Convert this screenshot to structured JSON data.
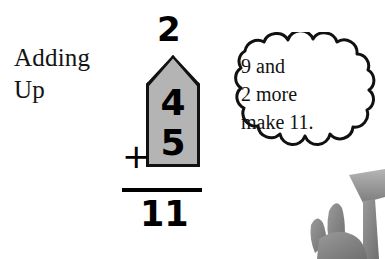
{
  "page": {
    "background_color": "#ffffff",
    "ink_color": "#000000"
  },
  "heading": {
    "line1": "Adding",
    "line2": "Up"
  },
  "problem": {
    "carry": "2",
    "addend_tens": "4",
    "addend_ones": "5",
    "operator": "+",
    "total": "11",
    "highlight_fill_color": "#b4b4b4",
    "highlight_outline_color": "#111111"
  },
  "thought_bubble": {
    "line1": "9 and",
    "line2": "2 more",
    "line3": "make 11.",
    "fill_color": "#ffffff",
    "outline_color": "#111111"
  },
  "corner_illustration": {
    "label": "hand-photo",
    "tone_color": "#8c8c8c"
  }
}
